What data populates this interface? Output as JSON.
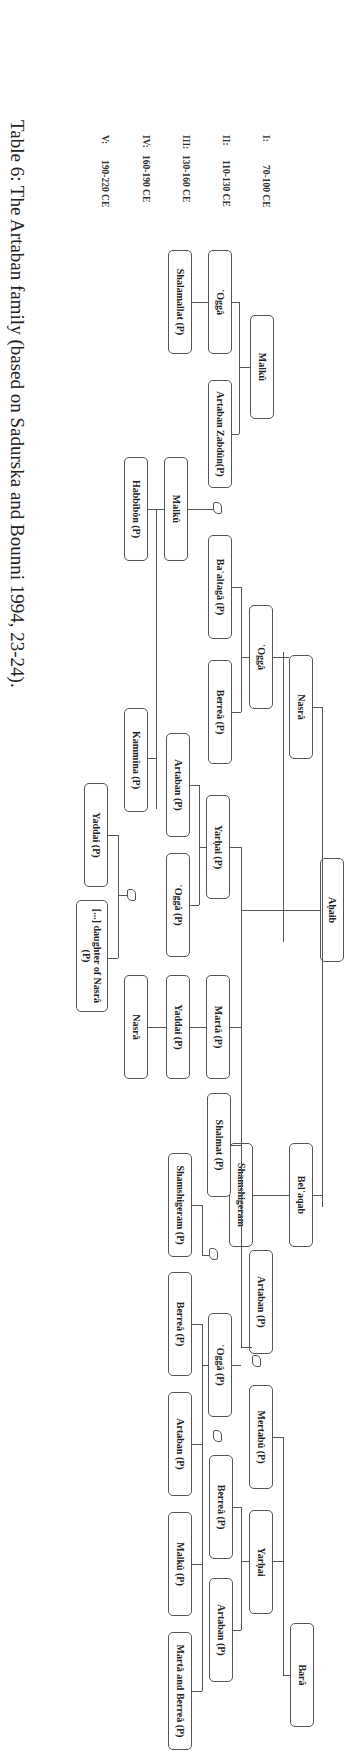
{
  "caption": "Table 6: The Artaban family (based on Sadurska and Bounni 1994, 23-24).",
  "generations": [
    {
      "label": "I:",
      "range": "70-100 CE"
    },
    {
      "label": "II:",
      "range": "110-130 CE"
    },
    {
      "label": "III:",
      "range": "130-160 CE"
    },
    {
      "label": "IV:",
      "range": "160-190 CE"
    },
    {
      "label": "V:",
      "range": "190-220 CE"
    }
  ],
  "nodes": {
    "ahaib": "Aḥaib",
    "malku_1": "Malkû",
    "nasra_1": "Nasrâ",
    "belaqab": "Bel῾aqab",
    "bara": "Barâ",
    "ogga_2": "῾Oggâ",
    "artaban_zabdun": "Artaban Zabdûn(P)",
    "ogga_nasra": "῾Oggâ",
    "yarhai_2": "Yarḥai (P)",
    "marta_2": "Martâ (P)",
    "shamshigeram_2": "Shamshigeram",
    "artaban_2": "Artaban (P)",
    "mertabu": "Mertabû (P)",
    "yarhai_bara": "Yarḥai",
    "shalamallat": "Shalamallat (P)",
    "malku_3": "Malkû",
    "baaltaga": "Ba῾altagâ (P)",
    "berrea_3": "Berreâ (P)",
    "artaban_3": "Artaban (P)",
    "ogga_3": "῾Oggâ (P)",
    "yaddai_3": "Yaddai (P)",
    "shalmat": "Shalmat (P)",
    "ogga_3b": "῾Oggâ (P)",
    "berrea_3b": "Berreâ (P)",
    "artaban_3b": "Artaban (P)",
    "habbibon": "Habbîbôn (P)",
    "kammina": "Kammîna (P)",
    "nasra_4": "Nasrâ",
    "shamshigeram_4": "Shamshigeram (P)",
    "berrea_4": "Berreâ (P)",
    "artaban_4": "Artaban (P)",
    "malku_4": "Malkû (P)",
    "marta_berrea": "Martâ and Berreâ (P)",
    "yaddai_5": "Yaddai (P)",
    "daughter_nasra": "[...] daughter of Nasrâ (P)"
  }
}
